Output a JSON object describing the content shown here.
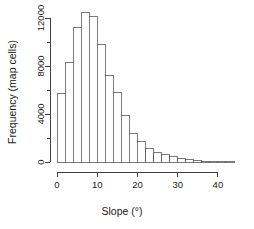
{
  "chart_data": {
    "type": "bar",
    "title": "",
    "xlabel": "Slope (°)",
    "ylabel": "Frequency (map cells)",
    "xlim": [
      0,
      44
    ],
    "ylim": [
      0,
      13000
    ],
    "grid": false,
    "legend": null,
    "bin_width": 2,
    "x_tick_labels": [
      "0",
      "10",
      "20",
      "30",
      "40"
    ],
    "x_tick_values": [
      0,
      10,
      20,
      30,
      40
    ],
    "x_minor_tick_values": [
      0,
      2,
      4,
      6,
      8,
      10,
      12,
      14,
      16,
      18,
      20,
      22,
      24,
      26,
      28,
      30,
      32,
      34,
      36,
      38,
      40,
      42,
      44
    ],
    "y_tick_labels": [
      "0",
      "4000",
      "8000",
      "12000"
    ],
    "y_tick_values": [
      0,
      4000,
      8000,
      12000
    ],
    "y_minor_tick_values": [
      0,
      2000,
      4000,
      6000,
      8000,
      10000,
      12000
    ],
    "bin_starts": [
      0,
      2,
      4,
      6,
      8,
      10,
      12,
      14,
      16,
      18,
      20,
      22,
      24,
      26,
      28,
      30,
      32,
      34,
      36,
      38,
      40,
      42
    ],
    "bin_ends": [
      2,
      4,
      6,
      8,
      10,
      12,
      14,
      16,
      18,
      20,
      22,
      24,
      26,
      28,
      30,
      32,
      34,
      36,
      38,
      40,
      42,
      44
    ],
    "categories": [
      "0-2",
      "2-4",
      "4-6",
      "6-8",
      "8-10",
      "10-12",
      "12-14",
      "14-16",
      "16-18",
      "18-20",
      "20-22",
      "22-24",
      "24-26",
      "26-28",
      "28-30",
      "30-32",
      "32-34",
      "34-36",
      "36-38",
      "38-40",
      "40-42",
      "42-44"
    ],
    "values": [
      5700,
      8300,
      11200,
      12500,
      12100,
      9800,
      7200,
      5800,
      3900,
      2400,
      1700,
      1150,
      800,
      620,
      450,
      330,
      200,
      120,
      70,
      40,
      20,
      10
    ],
    "bar_fill_color": "#ffffff",
    "bar_edge_color": "#5a5a5a",
    "axis_color": "#3f3f3f",
    "background_color": "#ffffff"
  },
  "axes": {
    "x_title": "Slope (°)",
    "y_title": "Frequency (map cells)"
  }
}
